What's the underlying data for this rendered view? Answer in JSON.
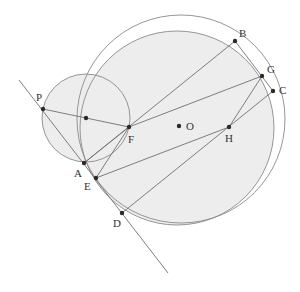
{
  "diagram": {
    "type": "geometry",
    "colors": {
      "fill": "#ededed",
      "stroke": "#8a8a8a",
      "line": "#707070",
      "point": "#2a2a2a",
      "text": "#333333"
    },
    "circles": [
      {
        "name": "outer-circle",
        "cx": 181,
        "cy": 119,
        "r": 104,
        "fill": false
      },
      {
        "name": "shaded-circle",
        "cx": 177,
        "cy": 128,
        "r": 97,
        "fill": true
      },
      {
        "name": "small-circle",
        "cx": 86,
        "cy": 118,
        "r": 44,
        "fill": true
      }
    ],
    "points": [
      {
        "label": "P",
        "x": 43,
        "y": 109,
        "lx": 36,
        "ly": 101
      },
      {
        "label": "",
        "x": 86,
        "y": 118,
        "lx": 0,
        "ly": 0
      },
      {
        "label": "F",
        "x": 129,
        "y": 127,
        "lx": 128,
        "ly": 143
      },
      {
        "label": "O",
        "x": 179,
        "y": 126,
        "lx": 186,
        "ly": 130
      },
      {
        "label": "A",
        "x": 84,
        "y": 163,
        "lx": 74,
        "ly": 177
      },
      {
        "label": "E",
        "x": 96,
        "y": 178,
        "lx": 84,
        "ly": 190
      },
      {
        "label": "D",
        "x": 122,
        "y": 213,
        "lx": 113,
        "ly": 227
      },
      {
        "label": "B",
        "x": 235,
        "y": 41,
        "lx": 239,
        "ly": 37
      },
      {
        "label": "G",
        "x": 262,
        "y": 76,
        "lx": 267,
        "ly": 73
      },
      {
        "label": "C",
        "x": 273,
        "y": 91,
        "lx": 279,
        "ly": 94
      },
      {
        "label": "H",
        "x": 229,
        "y": 127,
        "lx": 225,
        "ly": 142
      }
    ],
    "segments": [
      {
        "name": "tangent-line",
        "x1": 19,
        "y1": 80,
        "x2": 168,
        "y2": 273
      },
      {
        "name": "segment-PF",
        "x1": 43,
        "y1": 109,
        "x2": 129,
        "y2": 127
      },
      {
        "name": "segment-FG",
        "x1": 129,
        "y1": 127,
        "x2": 262,
        "y2": 76
      },
      {
        "name": "segment-AB",
        "x1": 84,
        "y1": 163,
        "x2": 235,
        "y2": 41
      },
      {
        "name": "segment-AF",
        "x1": 84,
        "y1": 163,
        "x2": 129,
        "y2": 127
      },
      {
        "name": "segment-EF",
        "x1": 96,
        "y1": 178,
        "x2": 129,
        "y2": 127
      },
      {
        "name": "segment-EH",
        "x1": 96,
        "y1": 178,
        "x2": 229,
        "y2": 127
      },
      {
        "name": "segment-HG",
        "x1": 229,
        "y1": 127,
        "x2": 262,
        "y2": 76
      },
      {
        "name": "segment-DC",
        "x1": 122,
        "y1": 213,
        "x2": 273,
        "y2": 91
      },
      {
        "name": "segment-BC",
        "x1": 235,
        "y1": 41,
        "x2": 273,
        "y2": 91
      }
    ]
  }
}
